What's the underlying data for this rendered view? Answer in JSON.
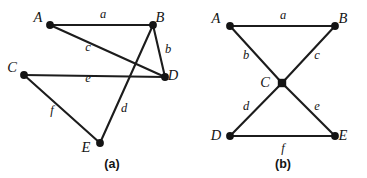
{
  "figure": {
    "background_color": "#ffffff",
    "line_color": "#1c1c1c",
    "width": 367,
    "height": 178,
    "panels": [
      {
        "id": "a",
        "caption": "(a)",
        "caption_pos": {
          "x": 112,
          "y": 168
        },
        "vertices": [
          {
            "id": "A",
            "label": "A",
            "x": 50,
            "y": 25,
            "shape": "dot",
            "label_x": 38,
            "label_y": 22
          },
          {
            "id": "B",
            "label": "B",
            "x": 153,
            "y": 25,
            "shape": "dot",
            "label_x": 160,
            "label_y": 22
          },
          {
            "id": "C",
            "label": "C",
            "x": 24,
            "y": 75,
            "shape": "dot",
            "label_x": 12,
            "label_y": 72
          },
          {
            "id": "D",
            "label": "D",
            "x": 165,
            "y": 77,
            "shape": "dot",
            "label_x": 173,
            "label_y": 80
          },
          {
            "id": "E",
            "label": "E",
            "x": 100,
            "y": 143,
            "shape": "dot",
            "label_x": 86,
            "label_y": 152
          }
        ],
        "edges": [
          {
            "id": "a",
            "label": "a",
            "from": "A",
            "to": "B",
            "label_x": 103,
            "label_y": 18
          },
          {
            "id": "c",
            "label": "c",
            "from": "A",
            "to": "D",
            "label_x": 88,
            "label_y": 51
          },
          {
            "id": "b",
            "label": "b",
            "from": "B",
            "to": "D",
            "label_x": 168,
            "label_y": 53
          },
          {
            "id": "d",
            "label": "d",
            "from": "B",
            "to": "E",
            "label_x": 124,
            "label_y": 112
          },
          {
            "id": "e",
            "label": "e",
            "from": "C",
            "to": "D",
            "label_x": 88,
            "label_y": 82
          },
          {
            "id": "f",
            "label": "f",
            "from": "C",
            "to": "E",
            "label_x": 52,
            "label_y": 114
          }
        ]
      },
      {
        "id": "b",
        "caption": "(b)",
        "caption_pos": {
          "x": 283,
          "y": 168
        },
        "vertices": [
          {
            "id": "A",
            "label": "A",
            "x": 230,
            "y": 26,
            "shape": "dot",
            "label_x": 216,
            "label_y": 23
          },
          {
            "id": "B",
            "label": "B",
            "x": 335,
            "y": 26,
            "shape": "dot",
            "label_x": 343,
            "label_y": 23
          },
          {
            "id": "C",
            "label": "C",
            "x": 282,
            "y": 83,
            "shape": "square",
            "label_x": 265,
            "label_y": 87
          },
          {
            "id": "D",
            "label": "D",
            "x": 230,
            "y": 136,
            "shape": "dot",
            "label_x": 216,
            "label_y": 140
          },
          {
            "id": "E",
            "label": "E",
            "x": 335,
            "y": 136,
            "shape": "dot",
            "label_x": 343,
            "label_y": 140
          }
        ],
        "edges": [
          {
            "id": "a",
            "label": "a",
            "from": "A",
            "to": "B",
            "label_x": 283,
            "label_y": 19
          },
          {
            "id": "b",
            "label": "b",
            "from": "A",
            "to": "C",
            "label_x": 246,
            "label_y": 59
          },
          {
            "id": "c",
            "label": "c",
            "from": "C",
            "to": "B",
            "label_x": 317,
            "label_y": 59
          },
          {
            "id": "d",
            "label": "d",
            "from": "C",
            "to": "D",
            "label_x": 246,
            "label_y": 110
          },
          {
            "id": "e",
            "label": "e",
            "from": "C",
            "to": "E",
            "label_x": 317,
            "label_y": 110
          },
          {
            "id": "f",
            "label": "f",
            "from": "D",
            "to": "E",
            "label_x": 283,
            "label_y": 152
          }
        ]
      }
    ]
  }
}
